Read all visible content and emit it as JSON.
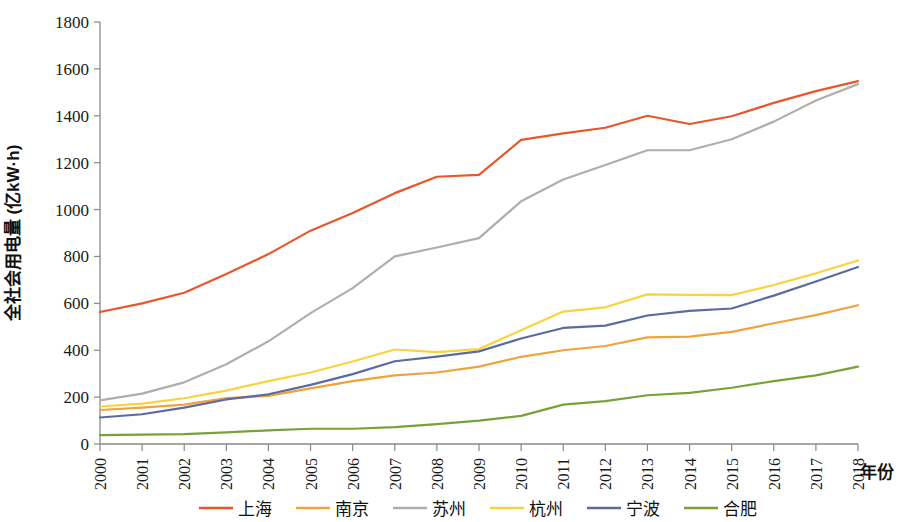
{
  "chart_data": {
    "type": "line",
    "title": "",
    "xlabel": "年份",
    "ylabel": "全社会用电量 (亿kW·h)",
    "x": [
      2000,
      2001,
      2002,
      2003,
      2004,
      2005,
      2006,
      2007,
      2008,
      2009,
      2010,
      2011,
      2012,
      2013,
      2014,
      2015,
      2016,
      2017,
      2018
    ],
    "xticklabels": [
      "2000",
      "2001",
      "2002",
      "2003",
      "2004",
      "2005",
      "2006",
      "2007",
      "2008",
      "2009",
      "2010",
      "2011",
      "2012",
      "2013",
      "2014",
      "2015",
      "2016",
      "2017",
      "2018"
    ],
    "yticklabels": [
      "0",
      "200",
      "400",
      "600",
      "800",
      "1000",
      "1200",
      "1400",
      "1600",
      "1800"
    ],
    "yticks": [
      0,
      200,
      400,
      600,
      800,
      1000,
      1200,
      1400,
      1600,
      1800
    ],
    "ylim": [
      0,
      1800
    ],
    "xlim": [
      2000,
      2018
    ],
    "grid": false,
    "legend_position": "bottom",
    "series": [
      {
        "name": "上海",
        "color": "#E8562A",
        "values": [
          563,
          600,
          645,
          725,
          810,
          910,
          985,
          1070,
          1140,
          1148,
          1297,
          1325,
          1349,
          1400,
          1365,
          1398,
          1455,
          1505,
          1548
        ]
      },
      {
        "name": "南京",
        "color": "#F0A23C",
        "values": [
          145,
          155,
          168,
          196,
          205,
          237,
          268,
          293,
          305,
          330,
          372,
          400,
          418,
          455,
          458,
          478,
          515,
          550,
          592
        ]
      },
      {
        "name": "苏州",
        "color": "#AFAFA9",
        "values": [
          186,
          215,
          263,
          340,
          438,
          558,
          665,
          800,
          838,
          878,
          1035,
          1128,
          1190,
          1253,
          1253,
          1300,
          1375,
          1465,
          1535
        ]
      },
      {
        "name": "杭州",
        "color": "#FAD23C",
        "values": [
          160,
          172,
          195,
          228,
          268,
          305,
          352,
          403,
          392,
          405,
          485,
          565,
          583,
          638,
          636,
          635,
          678,
          728,
          783
        ]
      },
      {
        "name": "宁波",
        "color": "#5A6BA0",
        "values": [
          113,
          127,
          155,
          190,
          212,
          252,
          298,
          353,
          373,
          395,
          450,
          495,
          505,
          548,
          568,
          578,
          633,
          693,
          755
        ]
      },
      {
        "name": "合肥",
        "color": "#76A338",
        "values": [
          38,
          40,
          42,
          50,
          58,
          65,
          65,
          72,
          85,
          100,
          120,
          168,
          183,
          208,
          218,
          240,
          268,
          293,
          330
        ]
      }
    ]
  },
  "legend": {
    "items": [
      {
        "label": "上海",
        "color": "#E8562A"
      },
      {
        "label": "南京",
        "color": "#F0A23C"
      },
      {
        "label": "苏州",
        "color": "#AFAFA9"
      },
      {
        "label": "杭州",
        "color": "#FAD23C"
      },
      {
        "label": "宁波",
        "color": "#5A6BA0"
      },
      {
        "label": "合肥",
        "color": "#76A338"
      }
    ]
  }
}
